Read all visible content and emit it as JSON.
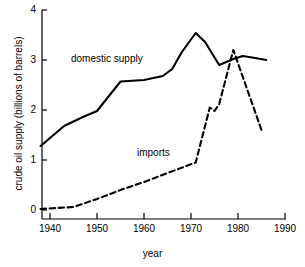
{
  "chart_data": {
    "type": "line",
    "title": "",
    "xlabel": "year",
    "ylabel": "crude oil supply (billions of barrels)",
    "xlim": [
      1936,
      1990
    ],
    "ylim": [
      0,
      4
    ],
    "xticks": [
      1940,
      1950,
      1960,
      1970,
      1980,
      1990
    ],
    "xtick_labels": [
      "1940",
      "1950",
      "1960",
      "1970",
      "1980",
      "1990"
    ],
    "yticks": [
      0,
      1,
      2,
      3,
      4
    ],
    "ytick_labels": [
      "0",
      "1",
      "2",
      "3",
      "4"
    ],
    "grid": false,
    "legend_position": "inline-annotations",
    "series": [
      {
        "name": "domestic supply",
        "style": "solid",
        "color": "#000000",
        "label_text": "domestic supply",
        "x": [
          1938,
          1943,
          1947,
          1950,
          1955,
          1960,
          1964,
          1966,
          1968,
          1971,
          1973,
          1976,
          1979,
          1981,
          1983,
          1986
        ],
        "values": [
          1.28,
          1.68,
          1.86,
          1.98,
          2.57,
          2.6,
          2.68,
          2.82,
          3.15,
          3.54,
          3.36,
          2.9,
          3.02,
          3.08,
          3.05,
          3.0
        ]
      },
      {
        "name": "imports",
        "style": "dashed",
        "color": "#000000",
        "label_text": "imports",
        "x": [
          1938,
          1945,
          1950,
          1955,
          1960,
          1965,
          1971,
          1974,
          1975,
          1976,
          1979,
          1985
        ],
        "values": [
          0.02,
          0.06,
          0.22,
          0.4,
          0.56,
          0.74,
          0.95,
          2.05,
          1.98,
          2.12,
          3.2,
          1.6
        ]
      }
    ]
  }
}
